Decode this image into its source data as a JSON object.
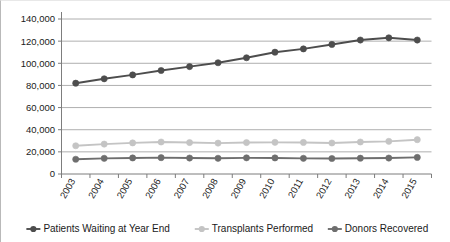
{
  "chart_data": {
    "type": "line",
    "title": "",
    "subtitle": "",
    "xlabel": "",
    "ylabel": "",
    "categories": [
      "2003",
      "2004",
      "2005",
      "2006",
      "2007",
      "2008",
      "2009",
      "2010",
      "2011",
      "2012",
      "2013",
      "2014",
      "2015"
    ],
    "ylim": [
      0,
      140000
    ],
    "ytick_step": 20000,
    "ytick_labels": [
      "0",
      "20,000",
      "40,000",
      "60,000",
      "80,000",
      "100,000",
      "120,000",
      "140,000"
    ],
    "ytick_values": [
      0,
      20000,
      40000,
      60000,
      80000,
      100000,
      120000,
      140000
    ],
    "grid": true,
    "grid_axis": "y",
    "legend_position": "bottom",
    "series": [
      {
        "name": "Patients Waiting at Year End",
        "color": "#4d4d4d",
        "marker": "circle",
        "values": [
          82000,
          86000,
          89500,
          93500,
          97000,
          100500,
          105000,
          110000,
          113000,
          117000,
          121000,
          123000,
          121000
        ]
      },
      {
        "name": "Transplants Performed",
        "color": "#c4c4c4",
        "marker": "circle",
        "values": [
          25500,
          27000,
          28100,
          28900,
          28400,
          27900,
          28400,
          28600,
          28500,
          28000,
          28900,
          29500,
          31000
        ]
      },
      {
        "name": "Donors Recovered",
        "color": "#6e6e6e",
        "marker": "circle",
        "values": [
          13300,
          14150,
          14500,
          14750,
          14400,
          14200,
          14600,
          14500,
          14150,
          14000,
          14250,
          14400,
          15000
        ]
      }
    ]
  },
  "legend": {
    "items": [
      {
        "label": "Patients Waiting at Year End",
        "color": "#4d4d4d"
      },
      {
        "label": "Transplants Performed",
        "color": "#c4c4c4"
      },
      {
        "label": "Donors Recovered",
        "color": "#6e6e6e"
      }
    ]
  }
}
